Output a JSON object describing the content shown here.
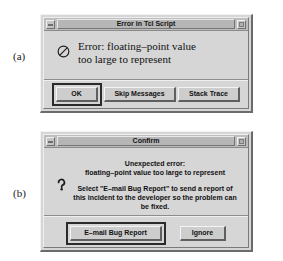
{
  "figure": {
    "part_a_label": "(a)",
    "part_b_label": "(b)"
  },
  "dialog_a": {
    "title": "Error in Tcl Script",
    "icon": "deny-circle-icon",
    "message_line_1": "Error: floating–point value",
    "message_line_2": "too large to represent",
    "buttons": {
      "ok": "OK",
      "skip_messages": "Skip Messages",
      "stack_trace": "Stack Trace"
    },
    "titlebar": {
      "minimize": "minimize-box",
      "resize": "resize-box"
    }
  },
  "dialog_b": {
    "title": "Confirm",
    "icon": "question-mark-icon",
    "message_line_1": "Unexpected error:",
    "message_line_2": "floating–point value too large to represent",
    "message_line_3": "Select \"E–mail Bug Report\" to send a report of",
    "message_line_4": "this incident to the developer so the problem can",
    "message_line_5": "be fixed.",
    "buttons": {
      "email_bug_report": "E–mail Bug Report",
      "ignore": "Ignore"
    },
    "titlebar": {
      "minimize": "minimize-box",
      "resize": "resize-box"
    }
  },
  "colors": {
    "face": "#d6d6d6",
    "titlebar": "#bdbdbd",
    "text": "#111111",
    "shadow": "#6b6b6b",
    "highlight": "#f2f2f2"
  }
}
